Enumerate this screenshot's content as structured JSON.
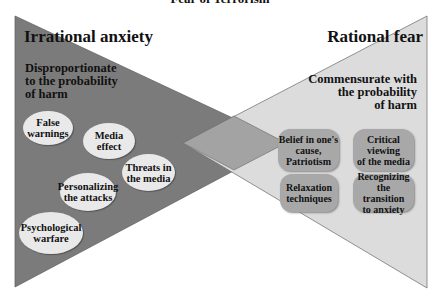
{
  "title": "Fear of Terrorism",
  "colors": {
    "irrational_fill": "#7b7b7b",
    "rational_fill": "#dcdcdc",
    "overlap_fill": "#a3a3a3",
    "ellipse_fill": "#e9e9e9",
    "box_fill": "#a8a8a8"
  },
  "left": {
    "heading": "Irrational anxiety",
    "subheading": [
      "Disproportionate",
      "to the probability",
      "of harm"
    ],
    "items": [
      [
        "False",
        "warnings"
      ],
      [
        "Media",
        "effect"
      ],
      [
        "Threats in",
        "the media"
      ],
      [
        "Personalizing",
        "the attacks"
      ],
      [
        "Psychological",
        "warfare"
      ]
    ]
  },
  "right": {
    "heading": "Rational fear",
    "subheading": [
      "Commensurate with",
      "the probability",
      "of harm"
    ],
    "items": [
      [
        "Belief in one's",
        "cause,",
        "Patriotism"
      ],
      [
        "Critical",
        "viewing",
        "of the media"
      ],
      [
        "Relaxation",
        "techniques"
      ],
      [
        "Recognizing the",
        "transition",
        "to anxiety"
      ]
    ]
  }
}
